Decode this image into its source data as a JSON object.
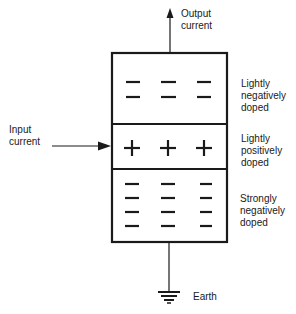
{
  "diagram": {
    "title": "",
    "labels": {
      "output": "Output\ncurrent",
      "input": "Input\ncurrent",
      "earth": "Earth"
    },
    "regions": [
      {
        "name": "top",
        "label": "Lightly\nnegatively\ndoped",
        "charge": "-",
        "rows": 2
      },
      {
        "name": "middle",
        "label": "Lightly\npositively\ndoped",
        "charge": "+",
        "rows": 1
      },
      {
        "name": "bottom",
        "label": "Strongly\nnegatively\ndoped",
        "charge": "-",
        "rows": 4
      }
    ]
  }
}
